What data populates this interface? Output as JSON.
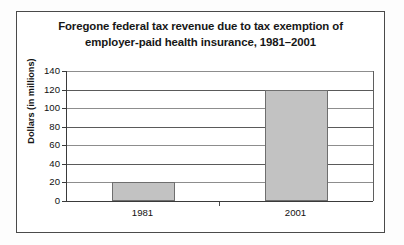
{
  "chart_data": {
    "type": "bar",
    "title": "Foregone federal tax revenue due to tax exemption of employer-paid health insurance, 1981–2001",
    "title_lines": [
      "Foregone federal tax revenue due to tax exemption of",
      "employer-paid health insurance, 1981–2001"
    ],
    "categories": [
      "1981",
      "2001"
    ],
    "values": [
      20,
      120
    ],
    "xlabel": "",
    "ylabel": "Dollars (in millions)",
    "ylim": [
      0,
      140
    ],
    "ytick_step": 20,
    "yticks": [
      "140",
      "120",
      "100",
      "80",
      "60",
      "40",
      "20",
      "0"
    ],
    "grid": "horizontal",
    "legend": "none",
    "bar_color": "#c2c2c2",
    "bar_border_color": "#6e6e6e",
    "axis_color": "#3a3a3a",
    "background_color": "#ffffff"
  }
}
